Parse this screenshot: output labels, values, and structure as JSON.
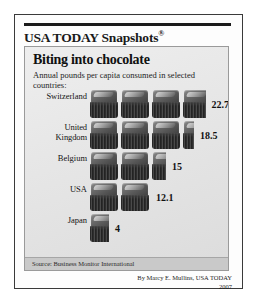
{
  "masthead": {
    "brand": "USA TODAY Snapshots",
    "registered_mark": "®"
  },
  "chart_data": {
    "type": "bar",
    "title": "Biting into chocolate",
    "subtitle": "Annual pounds per capita consumed in selected countries:",
    "xlabel": "",
    "ylabel": "",
    "unit": "pounds per capita",
    "grid": false,
    "legend": "none",
    "orientation": "horizontal",
    "pictogram_unit_value": 6,
    "categories": [
      "Switzerland",
      "United Kingdom",
      "Belgium",
      "USA",
      "Japan"
    ],
    "values": [
      22.7,
      18.5,
      15,
      12.1,
      4
    ],
    "value_labels": [
      "22.7",
      "18.5",
      "15",
      "12.1",
      "4"
    ],
    "xlim": [
      0,
      24
    ],
    "source": "Source: Business Monitor International"
  },
  "byline": {
    "credit": "By Marcy E. Mullins, USA TODAY",
    "year": "2007"
  }
}
